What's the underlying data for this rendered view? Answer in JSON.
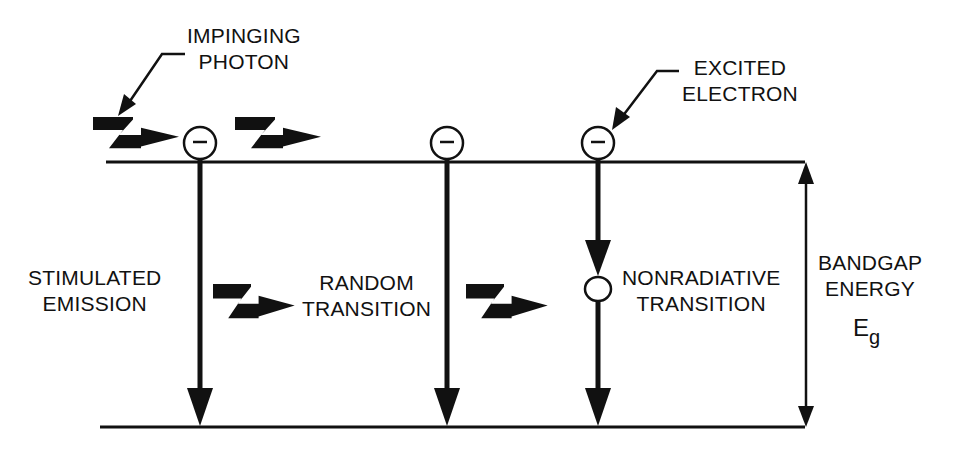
{
  "diagram": {
    "type": "semiconductor band transition diagram",
    "labels": {
      "impinging_photon": [
        "IMPINGING",
        "PHOTON"
      ],
      "excited_electron": [
        "EXCITED",
        "ELECTRON"
      ],
      "stimulated_emission": [
        "STIMULATED",
        "EMISSION"
      ],
      "random_transition": [
        "RANDOM",
        "TRANSITION"
      ],
      "nonradiative_transition": [
        "NONRADIATIVE",
        "TRANSITION"
      ],
      "bandgap_energy": [
        "BANDGAP",
        "ENERGY"
      ],
      "bandgap_symbol": "E",
      "bandgap_subscript": "g"
    },
    "electron_symbol": "−",
    "levels": [
      "conduction-band",
      "valence-band"
    ],
    "transitions": [
      {
        "name": "stimulated-emission",
        "emits_photon": true
      },
      {
        "name": "random-transition",
        "emits_photon": true
      },
      {
        "name": "nonradiative-transition",
        "emits_photon": false,
        "intermediate_state": true
      }
    ],
    "colors": {
      "ink": "#111111",
      "background": "#ffffff"
    }
  }
}
